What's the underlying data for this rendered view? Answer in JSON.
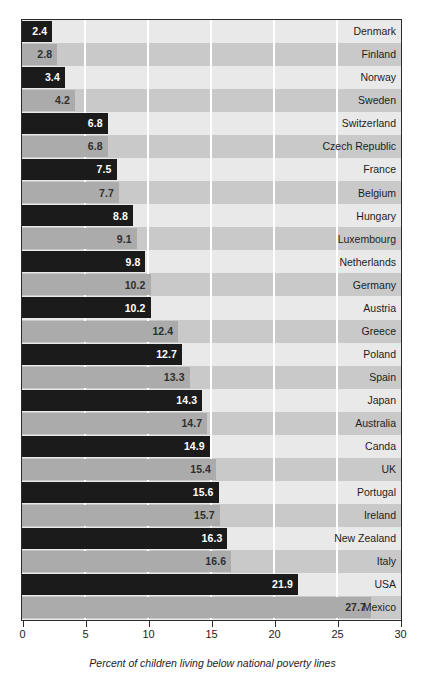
{
  "chart_data": {
    "type": "bar",
    "orientation": "horizontal",
    "title": "",
    "subtitle": "",
    "xlabel": "Percent of children living below national poverty lines",
    "ylabel": "",
    "xlim": [
      0,
      30
    ],
    "xticks": [
      0,
      5,
      10,
      15,
      20,
      25,
      30
    ],
    "xtick_labels": [
      "0",
      "5",
      "10",
      "15",
      "20",
      "25",
      "30"
    ],
    "grid": true,
    "grid_axis": "x",
    "legend": null,
    "categories": [
      "Denmark",
      "Finland",
      "Norway",
      "Sweden",
      "Switzerland",
      "Czech Republic",
      "France",
      "Belgium",
      "Hungary",
      "Luxembourg",
      "Netherlands",
      "Germany",
      "Austria",
      "Greece",
      "Poland",
      "Spain",
      "Japan",
      "Australia",
      "Canda",
      "UK",
      "Portugal",
      "Ireland",
      "New Zealand",
      "Italy",
      "USA",
      "Mexico"
    ],
    "values": [
      2.4,
      2.8,
      3.4,
      4.2,
      6.8,
      6.8,
      7.5,
      7.7,
      8.8,
      9.1,
      9.8,
      10.2,
      10.2,
      12.4,
      12.7,
      13.3,
      14.3,
      14.7,
      14.9,
      15.4,
      15.6,
      15.7,
      16.3,
      16.6,
      21.9,
      27.7
    ],
    "value_labels": [
      "2.4",
      "2.8",
      "3.4",
      "4.2",
      "6.8",
      "6.8",
      "7.5",
      "7.7",
      "8.8",
      "9.1",
      "9.8",
      "10.2",
      "10.2",
      "12.4",
      "12.7",
      "13.3",
      "14.3",
      "14.7",
      "14.9",
      "15.4",
      "15.6",
      "15.7",
      "16.3",
      "16.6",
      "21.9",
      "27.7"
    ],
    "bar_styles": [
      "dark",
      "light",
      "dark",
      "light",
      "dark",
      "light",
      "dark",
      "light",
      "dark",
      "light",
      "dark",
      "light",
      "dark",
      "light",
      "dark",
      "light",
      "dark",
      "light",
      "dark",
      "light",
      "dark",
      "light",
      "dark",
      "light",
      "dark",
      "light"
    ],
    "colors": {
      "bar_dark": "#1b1b1b",
      "bar_light": "#ababab",
      "row_stripe_odd": "#e9e9e9",
      "row_stripe_even": "#c9c9c9",
      "gridline": "#ffffff",
      "axis": "#2b2b2b",
      "text": "#1d1d1d",
      "value_on_dark": "#ffffff",
      "value_on_light": "#2f2f2f"
    }
  },
  "caption": {
    "text": "Percent of children living below national poverty lines"
  }
}
